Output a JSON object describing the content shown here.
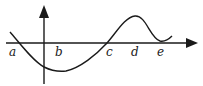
{
  "diagram": {
    "type": "function-graph",
    "colors": {
      "ink": "#1a1a1a",
      "background": "#ffffff"
    },
    "axes": {
      "x_axis": {
        "has_arrow": true,
        "direction": "right"
      },
      "y_axis": {
        "has_arrow": true,
        "direction": "up"
      }
    },
    "labels": [
      {
        "id": "a",
        "text": "a",
        "x": 13,
        "y": 55
      },
      {
        "id": "b",
        "text": "b",
        "x": 58,
        "y": 55
      },
      {
        "id": "c",
        "text": "c",
        "x": 106,
        "y": 55
      },
      {
        "id": "d",
        "text": "d",
        "x": 131,
        "y": 55
      },
      {
        "id": "e",
        "text": "e",
        "x": 157,
        "y": 55
      }
    ],
    "curve_description": "Curve crosses x-axis at a, reaches a minimum near b, crosses x-axis again at c, has a local maximum above d, and a local minimum touching the axis near e."
  }
}
